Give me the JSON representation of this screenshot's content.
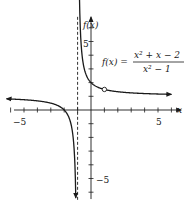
{
  "chart_data": {
    "type": "line",
    "title": "",
    "formula": {
      "lhs": "f(x) =",
      "numerator": "x² + x − 2",
      "denominator": "x² − 1"
    },
    "xlabel": "x",
    "ylabel": "f(x)",
    "xlim": [
      -6.5,
      6.5
    ],
    "ylim": [
      -6.5,
      6.5
    ],
    "x_ticks": [
      -6,
      -5,
      -4,
      -3,
      -2,
      -1,
      1,
      2,
      3,
      4,
      5,
      6
    ],
    "x_tick_labels": [
      {
        "value": -5,
        "label": "−5"
      },
      {
        "value": 5,
        "label": "5"
      }
    ],
    "y_ticks": [
      -6,
      -5,
      -4,
      -3,
      -2,
      -1,
      1,
      2,
      3,
      4,
      5,
      6
    ],
    "y_tick_labels": [
      {
        "value": 5,
        "label": "5"
      },
      {
        "value": -5,
        "label": "−5"
      }
    ],
    "grid": false,
    "vertical_asymptote": {
      "x": -1,
      "style": "dashed"
    },
    "horizontal_asymptote": {
      "y": 1
    },
    "hole": {
      "x": 1,
      "y": 1.5
    },
    "series": [
      {
        "name": "f(x) left branch",
        "x": [
          -6,
          -5,
          -4,
          -3,
          -2.5,
          -2,
          -1.8,
          -1.6,
          -1.4,
          -1.3,
          -1.2,
          -1.15
        ],
        "values": [
          0.8,
          0.75,
          0.667,
          0.5,
          0.333,
          0,
          -0.25,
          -0.667,
          -1.5,
          -2.333,
          -4,
          -5.667
        ]
      },
      {
        "name": "f(x) right branch",
        "x": [
          -0.85,
          -0.8,
          -0.7,
          -0.6,
          -0.5,
          -0.3,
          0,
          0.5,
          1,
          2,
          3,
          4,
          5,
          6
        ],
        "values": [
          7.667,
          6,
          4.333,
          3.5,
          3,
          2.429,
          2,
          1.667,
          1.5,
          1.333,
          1.25,
          1.2,
          1.167,
          1.143
        ]
      }
    ]
  }
}
